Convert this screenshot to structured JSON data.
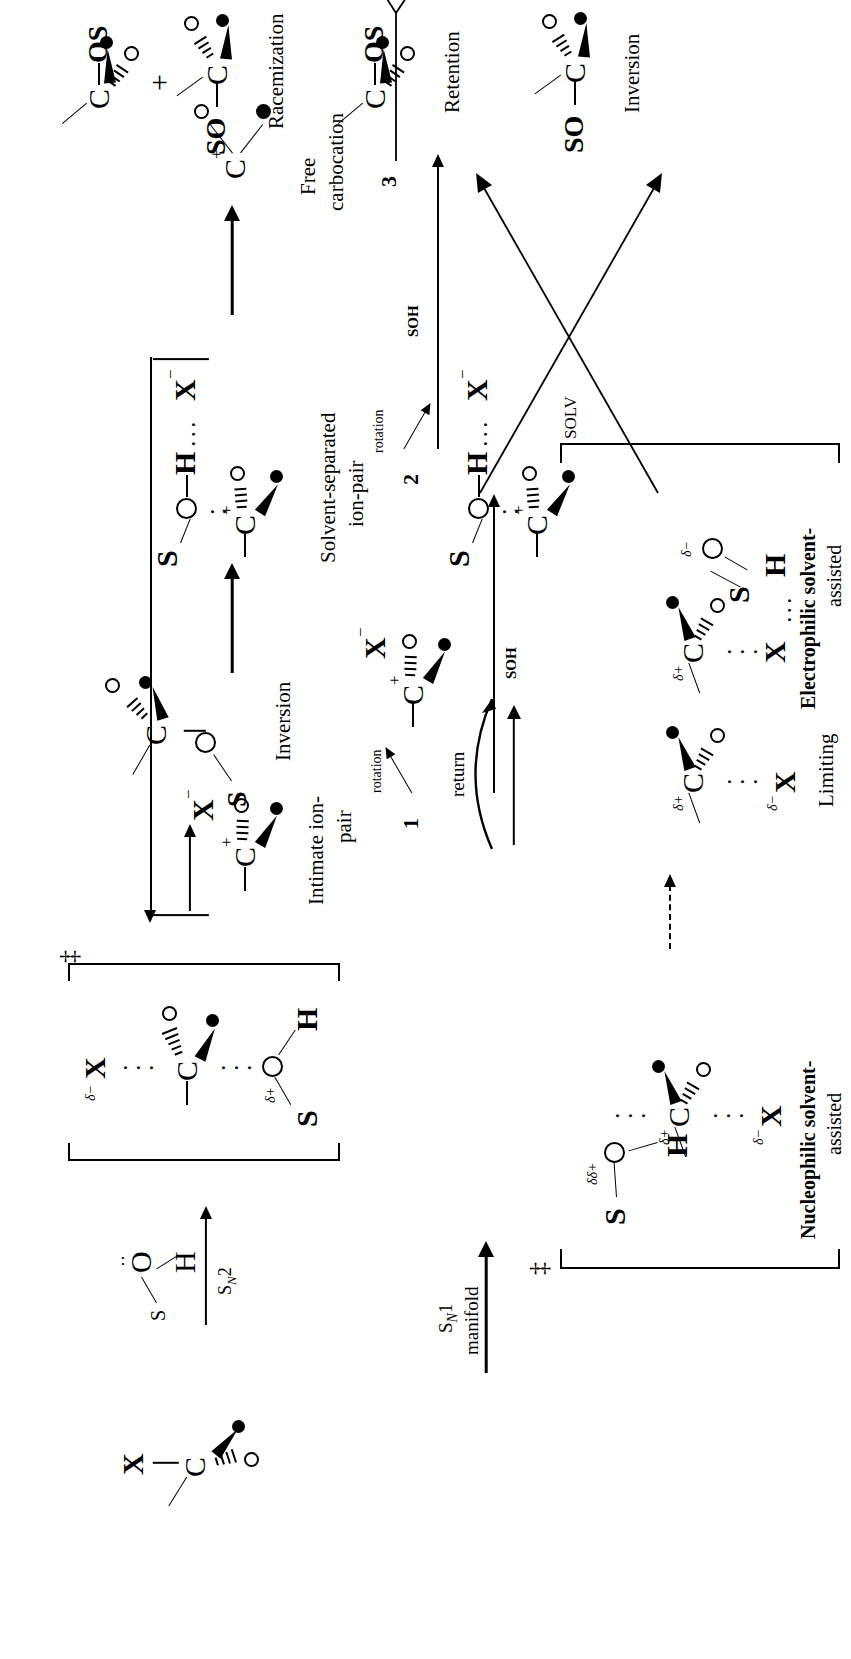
{
  "figure": {
    "domain": "chemistry-reaction-scheme"
  },
  "sn2_row": {
    "substrate_label": "R-X substrate",
    "atoms": {
      "c": "C",
      "x": "X",
      "o": "O"
    },
    "reagent": {
      "s": "S",
      "o": "O",
      "h": "H",
      "lone_pair": "··"
    },
    "arrow_label": "Sₙ2",
    "arrow_label_parts": {
      "s": "S",
      "n": "N",
      "num": "2"
    },
    "transition_state": {
      "bracket_charge": "‡",
      "x_label": "X",
      "x_delta": "δ−",
      "c_label": "C",
      "o_top": "O",
      "o_bottom": "O",
      "o_delta": "δ+",
      "s": "S",
      "h": "H"
    },
    "product": {
      "s": "S",
      "o": "O",
      "c": "C",
      "o_small": "O",
      "caption": "Inversion"
    }
  },
  "manifold_arrow": {
    "line1": "Sₙ1",
    "line1_parts": {
      "s": "S",
      "n": "N",
      "num": "1"
    },
    "line2": "manifold"
  },
  "ts_types_box": {
    "bracket_charge": "‡",
    "solv_label": "SOLV",
    "number": "4",
    "caption_line1": "Transition-state",
    "caption_line2": "types",
    "items": [
      {
        "name": "nucleophilic",
        "caption_line1": "Nucleophilic solvent-",
        "caption_line2": "assisted",
        "atoms": {
          "s": "S",
          "o_top": "O",
          "h": "H",
          "c": "C",
          "x": "X",
          "o_small": "O"
        },
        "deltas": {
          "o_top": "δδ+",
          "c": "δ+",
          "x": "δ−"
        }
      },
      {
        "name": "limiting",
        "caption_line1": "Limiting",
        "caption_line2": "",
        "atoms": {
          "c": "C",
          "x": "X",
          "o_small": "O"
        },
        "deltas": {
          "c": "δ+",
          "x": "δ−"
        }
      },
      {
        "name": "electrophilic",
        "caption_line1": "Electrophilic solvent-",
        "caption_line2": "assisted",
        "atoms": {
          "s": "S",
          "o_top": "O",
          "h": "H",
          "c": "C",
          "x": "X",
          "o_small": "O"
        },
        "deltas": {
          "o_top": "δ−",
          "c": "δ+"
        }
      }
    ],
    "inner_arrow": "dashed-right-arrow"
  },
  "return_arrow": {
    "label": "return"
  },
  "ion_pair_row": [
    {
      "id": "intimate",
      "number": "1",
      "caption_line1": "Intimate ion-",
      "caption_line2": "pair",
      "atoms": {
        "c": "C",
        "c_charge": "+",
        "x": "X",
        "x_charge": "−",
        "o": "O"
      }
    },
    {
      "id": "solvent-separated",
      "number": "2",
      "caption_line1": "Solvent-separated",
      "caption_line2": "ion-pair",
      "atoms": {
        "s": "S",
        "o": "O",
        "h": "H",
        "x": "X",
        "x_charge": "−",
        "c": "C",
        "c_charge": "+",
        "o_small": "O"
      }
    },
    {
      "id": "free-carbocation",
      "number": "3",
      "caption_line1": "Free",
      "caption_line2": "carbocation",
      "atoms": {
        "c": "C",
        "c_charge": "+",
        "o_open": "O",
        "o_filled": "●"
      }
    }
  ],
  "rotation_labels": {
    "one": "rotation",
    "two": "rotation"
  },
  "soh_labels": {
    "one": "SOH",
    "two": "SOH"
  },
  "rotated_intermediates": [
    {
      "id": "rot-intimate",
      "atoms": {
        "c": "C",
        "c_charge": "+",
        "x": "X",
        "x_charge": "−",
        "o": "O"
      }
    },
    {
      "id": "rot-solvent-separated",
      "atoms": {
        "s": "S",
        "o": "O",
        "h": "H",
        "x": "X",
        "x_charge": "−",
        "c": "C",
        "c_charge": "+",
        "o_small": "O"
      }
    }
  ],
  "products": [
    {
      "id": "inversion",
      "caption": "Inversion",
      "atoms": {
        "so": "SO",
        "c": "C",
        "o": "O"
      }
    },
    {
      "id": "retention",
      "caption": "Retention",
      "atoms": {
        "c": "C",
        "os": "OS",
        "o": "O"
      }
    },
    {
      "id": "racemization",
      "caption": "Racemization",
      "plus": "+",
      "top": {
        "c": "C",
        "os": "OS",
        "o": "O"
      },
      "bottom": {
        "so": "SO",
        "c": "C",
        "o": "O"
      }
    }
  ],
  "colors": {
    "ink": "#000000",
    "paper": "#ffffff"
  }
}
